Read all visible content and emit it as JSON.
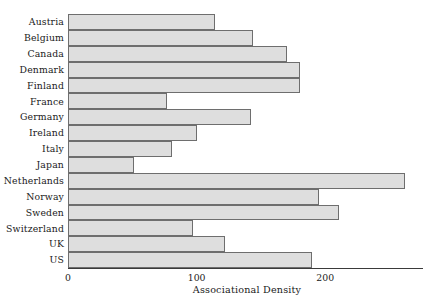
{
  "chart_data": {
    "type": "bar",
    "orientation": "horizontal",
    "title": "",
    "subtitle": "",
    "xlabel": "Associational Density",
    "ylabel": "",
    "categories": [
      "Austria",
      "Belgium",
      "Canada",
      "Denmark",
      "Finland",
      "France",
      "Germany",
      "Ireland",
      "Italy",
      "Japan",
      "Netherlands",
      "Norway",
      "Sweden",
      "Switzerland",
      "UK",
      "US"
    ],
    "values": [
      114,
      144,
      170,
      180,
      180,
      77,
      142,
      100,
      81,
      51,
      262,
      195,
      211,
      97,
      122,
      190
    ],
    "xlim": [
      0,
      276
    ],
    "ylim": null,
    "xticks": [
      0,
      100,
      200
    ],
    "xtick_labels": [
      "0",
      "100",
      "200"
    ],
    "grid": false,
    "legend": null,
    "legend_position": "none",
    "annotations": [],
    "series": [
      {
        "name": "Associational Density",
        "values": [
          114,
          144,
          170,
          180,
          180,
          77,
          142,
          100,
          81,
          51,
          262,
          195,
          211,
          97,
          122,
          190
        ]
      }
    ],
    "colors": {
      "bar_fill": "#dedede",
      "bar_border": "#6e6e6e",
      "axis": "#3a3a3a",
      "text": "#1a1a1a",
      "background": "#ffffff"
    }
  }
}
